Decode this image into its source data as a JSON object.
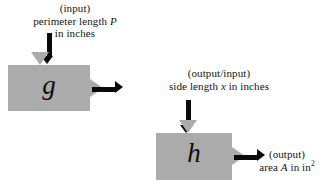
{
  "diagram": {
    "type": "function-machine-chain",
    "colors": {
      "machine_fill": "#ababab",
      "arrow": "#0a0a0a",
      "background": "#ffffff",
      "text": "#131313"
    },
    "labels": {
      "input": {
        "line1": "(input)",
        "line2_pre": "perimeter length ",
        "line2_var": "P",
        "line3": "in inches"
      },
      "middle": {
        "line1": "(output/input)",
        "line2_pre": "side length ",
        "line2_var": "x",
        "line2_post": " in inches"
      },
      "output": {
        "line1": "(output)",
        "line2_pre": "area ",
        "line2_var": "A",
        "line2_post": " in in",
        "line2_sup": "2"
      }
    },
    "machines": [
      {
        "id": "g",
        "letter": "g",
        "input_port": "top",
        "output_port": "right"
      },
      {
        "id": "h",
        "letter": "h",
        "input_port": "top",
        "output_port": "right"
      }
    ]
  }
}
